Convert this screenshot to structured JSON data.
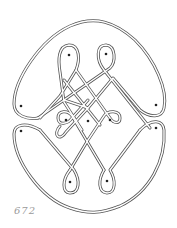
{
  "figure": {
    "number": "672",
    "stroke_color": "#555555",
    "dot_color": "#222222",
    "dots": [
      {
        "x": 21,
        "y": 106
      },
      {
        "x": 156,
        "y": 105
      },
      {
        "x": 69,
        "y": 55
      },
      {
        "x": 106,
        "y": 54
      },
      {
        "x": 66,
        "y": 120
      },
      {
        "x": 88,
        "y": 121
      },
      {
        "x": 110,
        "y": 120
      },
      {
        "x": 21,
        "y": 131
      },
      {
        "x": 156,
        "y": 128
      },
      {
        "x": 70,
        "y": 182
      },
      {
        "x": 107,
        "y": 181
      }
    ]
  }
}
